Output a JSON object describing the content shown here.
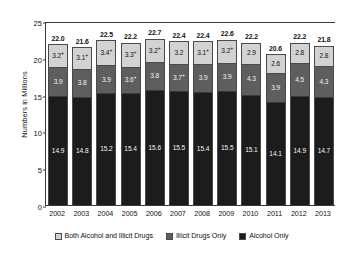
{
  "chart_data": {
    "type": "bar",
    "subtype": "stacked-bar",
    "title": "",
    "xlabel": "",
    "ylabel": "Numbers in Millions",
    "ylim": [
      0,
      25
    ],
    "yticks": [
      0,
      5,
      10,
      15,
      20,
      25
    ],
    "grid": false,
    "legend_position": "bottom",
    "categories": [
      "2002",
      "2003",
      "2004",
      "2005",
      "2006",
      "2007",
      "2008",
      "2009",
      "2010",
      "2011",
      "2012",
      "2013"
    ],
    "series": [
      {
        "name": "Alcohol Only",
        "color": "#1c1c1c",
        "values": [
          14.9,
          14.8,
          15.2,
          15.4,
          15.6,
          15.5,
          15.4,
          15.5,
          15.1,
          14.1,
          14.9,
          14.7
        ],
        "labels": [
          "14.9",
          "14.8",
          "15.2",
          "15.4",
          "15.6",
          "15.5",
          "15.4",
          "15.5",
          "15.1",
          "14.1",
          "14.9",
          "14.7"
        ]
      },
      {
        "name": "Illicit Drugs Only",
        "color": "#5e5e5e",
        "values": [
          3.9,
          3.8,
          3.9,
          3.6,
          3.8,
          3.7,
          3.9,
          3.9,
          4.3,
          3.9,
          4.5,
          4.3
        ],
        "labels": [
          "3.9",
          "3.8",
          "3.9",
          "3.6",
          "3.8",
          "3.7",
          "3.9",
          "3.9",
          "4.3",
          "3.9",
          "4.5",
          "4.3"
        ],
        "significance": [
          "",
          "",
          "",
          "+",
          "",
          "+",
          "",
          "",
          "",
          "",
          "",
          ""
        ]
      },
      {
        "name": "Both Alcohol and Illicit Drugs",
        "color": "#d2d2d2",
        "values": [
          3.2,
          3.1,
          3.4,
          3.3,
          3.2,
          3.2,
          3.1,
          3.2,
          2.9,
          2.6,
          2.8,
          2.8
        ],
        "labels": [
          "3.2",
          "3.1",
          "3.4",
          "3.3",
          "3.2",
          "3.2",
          "3.1",
          "3.2",
          "2.9",
          "2.6",
          "2.8",
          "2.8"
        ],
        "significance": [
          "+",
          "+",
          "+",
          "+",
          "+",
          "",
          "+",
          "+",
          "",
          "",
          "",
          ""
        ]
      }
    ],
    "totals": [
      22.0,
      21.6,
      22.5,
      22.2,
      22.7,
      22.4,
      22.4,
      22.6,
      22.2,
      20.6,
      22.2,
      21.8
    ],
    "total_labels": [
      "22.0",
      "21.6",
      "22.5",
      "22.2",
      "22.7",
      "22.4",
      "22.4",
      "22.6",
      "22.2",
      "20.6",
      "22.2",
      "21.8"
    ]
  },
  "legend": {
    "items": [
      {
        "label": "Both Alcohol and Illicit Drugs",
        "color": "#d2d2d2"
      },
      {
        "label": "Illicit Drugs Only",
        "color": "#5e5e5e"
      },
      {
        "label": "Alcohol Only",
        "color": "#1c1c1c"
      }
    ]
  }
}
